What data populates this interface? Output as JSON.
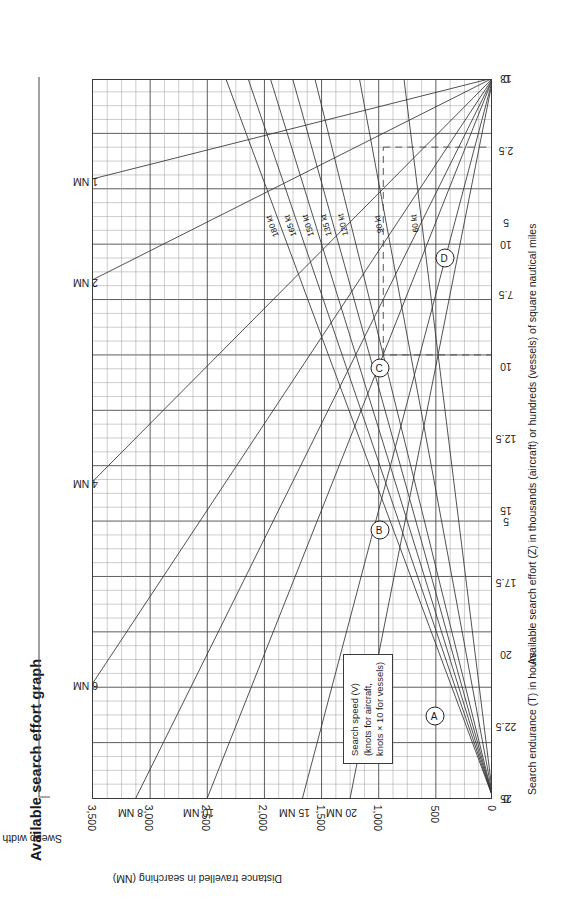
{
  "title": "Available search effort graph",
  "chart_data": {
    "type": "line",
    "title": "Available search effort graph",
    "subtitle": "",
    "orientation": "rotated-90-ccw",
    "grid": true,
    "legend_position": "inside-lower-left",
    "axes": {
      "y": {
        "label": "Distance travelled in searching (NM)",
        "ticks": [
          "0",
          "500",
          "1,000",
          "1,500",
          "2,000",
          "2,500",
          "3,000",
          "3,500"
        ],
        "values": [
          0,
          500,
          1000,
          1500,
          2000,
          2500,
          3000,
          3500
        ],
        "range": [
          0,
          3500
        ],
        "minor_step": 125
      },
      "x_bottom": {
        "label": "Search endurance (T) in hours",
        "ticks": [
          "0",
          "5",
          "10",
          "13"
        ],
        "values": [
          0,
          5,
          10,
          13
        ],
        "range": [
          0,
          13
        ]
      },
      "x_top": {
        "label": "Available search effort (Z) in thousands (aircraft) or hundreds (vessels) of square nautical miles",
        "ticks": [
          "0",
          "2.5",
          "5",
          "7.5",
          "10",
          "12.5",
          "15",
          "17.5",
          "20",
          "22.5",
          "25"
        ],
        "values": [
          0,
          2.5,
          5,
          7.5,
          10,
          12.5,
          15,
          17.5,
          20,
          22.5,
          25
        ],
        "range": [
          0,
          25
        ]
      }
    },
    "legend_box": {
      "line1": "Search speed (V)",
      "line2": "(knots for aircraft,",
      "line3": "knots × 10 for vessels)"
    },
    "speed_series": {
      "note": "Lines radiate from origin (T=0, D=0); D = V × T",
      "labels": [
        "180 kt",
        "165 kt",
        "150 kt",
        "135 kt",
        "120 kt",
        "90 kt",
        "60 kt"
      ],
      "values": [
        180,
        165,
        150,
        135,
        120,
        90,
        60
      ],
      "unit": "kt"
    },
    "sweep_width_series": {
      "name": "Sweep width (W)",
      "note": "Lines radiate from the Z=0 / D=0 corner; Z = W × D",
      "labels": [
        "1 NM",
        "2 NM",
        "4 NM",
        "6 NM",
        "8 NM",
        "10 NM",
        "15 NM",
        "20 NM"
      ],
      "values": [
        1,
        2,
        4,
        6,
        8,
        10,
        15,
        20
      ],
      "unit": "NM"
    },
    "markers": [
      {
        "label": "A",
        "axis": "search endurance (T)",
        "value": 8,
        "units": "hours"
      },
      {
        "label": "B",
        "axis": "distance travelled",
        "value": 960,
        "units": "NM"
      },
      {
        "label": "C",
        "axis": "distance travelled",
        "value": 960,
        "units": "NM"
      },
      {
        "label": "D",
        "axis": "available search effort (Z)",
        "value": 2.4,
        "units": "thousands of sq NM"
      }
    ],
    "sweep_title": "Sweep width (W)"
  }
}
